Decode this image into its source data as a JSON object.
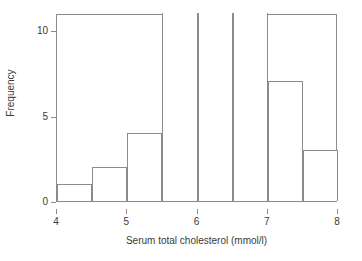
{
  "chart_data": {
    "type": "bar",
    "title": "",
    "subtitle": "",
    "xlabel": "Serum total cholesterol (mmol/l)",
    "ylabel": "Frequency",
    "grid": false,
    "legend": null,
    "xlim": [
      4,
      8
    ],
    "ylim": [
      0,
      11
    ],
    "xticks": [
      4,
      5,
      6,
      7,
      8
    ],
    "xtick_labels": [
      "4",
      "5",
      "6",
      "7",
      "8"
    ],
    "yticks": [
      0,
      5,
      10
    ],
    "ytick_labels": [
      "0",
      "5",
      "10"
    ],
    "bin_width": 0.5,
    "bin_edges": [
      4,
      4.5,
      5,
      5.5,
      6,
      6.5,
      7,
      7.5,
      8
    ],
    "categories": [
      "4-4.5",
      "4.5-5",
      "5-5.5",
      "5.5-6",
      "6-6.5",
      "6.5-7",
      "7-7.5",
      "7.5-8"
    ],
    "values": [
      1,
      2,
      4,
      11,
      11,
      11,
      7,
      3
    ],
    "bars": [
      {
        "label": "4-4.5",
        "x0": 4.0,
        "x1": 4.5,
        "value": 1
      },
      {
        "label": "4.5-5",
        "x0": 4.5,
        "x1": 5.0,
        "value": 2
      },
      {
        "label": "5-5.5",
        "x0": 5.0,
        "x1": 5.5,
        "value": 4
      },
      {
        "label": "5.5-6",
        "x0": 5.5,
        "x1": 6.0,
        "value": 11
      },
      {
        "label": "6-6.5",
        "x0": 6.0,
        "x1": 6.5,
        "value": 11
      },
      {
        "label": "6.5-7",
        "x0": 6.5,
        "x1": 7.0,
        "value": 11
      },
      {
        "label": "7-7.5",
        "x0": 7.0,
        "x1": 7.5,
        "value": 7
      },
      {
        "label": "7.5-8",
        "x0": 7.5,
        "x1": 8.0,
        "value": 3
      }
    ],
    "colors": {
      "bar_fill": "#ffffff",
      "bar_edge": "#8c8c8c",
      "axis": "#8c8c8c",
      "text": "#3a3a3a",
      "background": "#ffffff"
    }
  }
}
